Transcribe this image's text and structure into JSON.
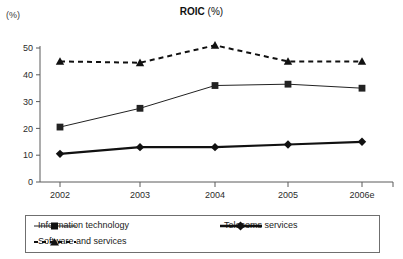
{
  "chart_data": {
    "type": "line",
    "title": "ROIC (%)",
    "title_bold_part": "ROIC",
    "title_normal_part": " (%)",
    "ylabel": "(%)",
    "xlabel": "",
    "categories": [
      "2002",
      "2003",
      "2004",
      "2005",
      "2006e"
    ],
    "ylim": [
      0,
      50
    ],
    "yticks": [
      0,
      10,
      20,
      30,
      40,
      50
    ],
    "ytick_labels": [
      "0",
      "10",
      "20",
      "30",
      "40",
      "50"
    ],
    "grid": false,
    "legend_position": "bottom",
    "series": [
      {
        "name": "Information technology",
        "values": [
          20.5,
          27.5,
          36.0,
          36.5,
          35.0
        ],
        "marker": "square",
        "line_style": "solid",
        "line_width": 1,
        "color": "#222222"
      },
      {
        "name": "Telecoms services",
        "values": [
          10.5,
          13.0,
          13.0,
          14.0,
          15.0
        ],
        "marker": "diamond",
        "line_style": "solid",
        "line_width": 2.2,
        "color": "#111111"
      },
      {
        "name": "Software and services",
        "values": [
          45.0,
          44.5,
          51.0,
          45.0,
          45.0
        ],
        "marker": "triangle",
        "line_style": "dashed",
        "line_width": 2,
        "color": "#111111"
      }
    ]
  },
  "legend": {
    "items": [
      {
        "label": "Information technology"
      },
      {
        "label": "Telecoms services"
      },
      {
        "label": "Software and services"
      }
    ]
  },
  "colors": {
    "axis": "#5a5a5a",
    "text": "#1a1a1a",
    "series_primary": "#222222",
    "legend_border": "#6f6f6f",
    "background": "#ffffff"
  }
}
